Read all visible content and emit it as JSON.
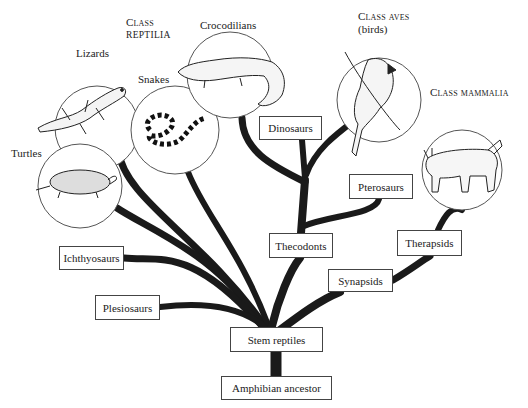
{
  "diagram": {
    "colors": {
      "branch": "#1a1a1a",
      "box_border": "#444444",
      "circle_border": "#555555",
      "text": "#222222"
    },
    "class_labels": [
      {
        "id": "reptilia",
        "line1": "Class",
        "line2": "reptilia"
      },
      {
        "id": "aves",
        "line1": "Class aves",
        "line2": "(birds)"
      },
      {
        "id": "mammalia",
        "line1": "Class mammalia"
      }
    ],
    "circle_labels": {
      "lizards": "Lizards",
      "snakes": "Snakes",
      "crocodilians": "Crocodilians",
      "turtles": "Turtles"
    },
    "illustrations": [
      {
        "id": "lizard",
        "icon": "lizard-icon"
      },
      {
        "id": "snake",
        "icon": "snake-icon"
      },
      {
        "id": "crocodile",
        "icon": "crocodile-icon"
      },
      {
        "id": "turtle",
        "icon": "turtle-icon"
      },
      {
        "id": "bird",
        "icon": "cardinal-bird-icon"
      },
      {
        "id": "mammal",
        "icon": "bobcat-icon"
      }
    ],
    "boxes": {
      "dinosaurs": "Dinosaurs",
      "pterosaurs": "Pterosaurs",
      "thecodonts": "Thecodonts",
      "therapsids": "Therapsids",
      "synapsids": "Synapsids",
      "ichthyosaurs": "Ichthyosaurs",
      "plesiosaurs": "Plesiosaurs",
      "stem_reptiles": "Stem reptiles",
      "amphibian_ancestor": "Amphibian ancestor"
    }
  }
}
